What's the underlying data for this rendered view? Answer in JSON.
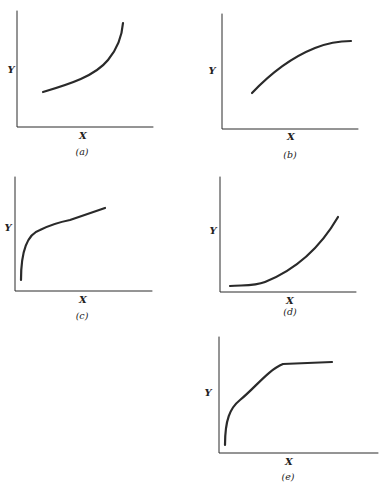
{
  "figure": {
    "ink_color": "#2a2a2a",
    "panels": [
      {
        "id": "a",
        "caption": "(a)",
        "x_label": "X",
        "y_label": "Y",
        "shape": "convex increasing (accelerating)"
      },
      {
        "id": "b",
        "caption": "(b)",
        "x_label": "X",
        "y_label": "Y",
        "shape": "concave increasing (decelerating)"
      },
      {
        "id": "c",
        "caption": "(c)",
        "x_label": "X",
        "y_label": "Y",
        "shape": "steep rise then linear increase"
      },
      {
        "id": "d",
        "caption": "(d)",
        "x_label": "X",
        "y_label": "Y",
        "shape": "flat then convex increase"
      },
      {
        "id": "e",
        "caption": "(e)",
        "x_label": "X",
        "y_label": "Y",
        "shape": "steep rise then plateau (saturating)"
      }
    ]
  }
}
